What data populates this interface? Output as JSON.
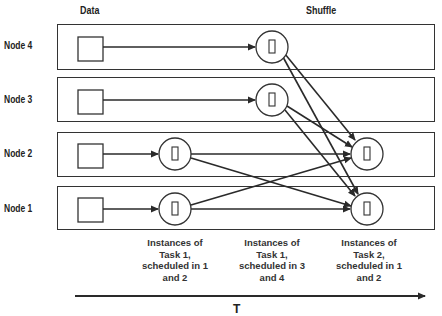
{
  "headers": {
    "data": "Data",
    "shuffle": "Shuffle"
  },
  "nodes": [
    {
      "label": "Node 4"
    },
    {
      "label": "Node 3"
    },
    {
      "label": "Node 2"
    },
    {
      "label": "Node 1"
    }
  ],
  "captions": [
    {
      "text": "Instances of Task 1, scheduled in 1 and 2",
      "lines": [
        "Instances of",
        "Task 1,",
        "scheduled in 1",
        "and 2"
      ]
    },
    {
      "text": "Instances of Task 1, scheduled in 3 and 4",
      "lines": [
        "Instances of",
        "Task 1,",
        "scheduled in 3",
        "and 4"
      ]
    },
    {
      "text": "Instances of Task 2, scheduled in 1 and 2",
      "lines": [
        "Instances of",
        "Task 2,",
        "scheduled in 1",
        "and 2"
      ]
    }
  ],
  "axis": {
    "label": "T"
  },
  "colors": {
    "stroke": "#2a2a2a",
    "background": "#ffffff"
  }
}
